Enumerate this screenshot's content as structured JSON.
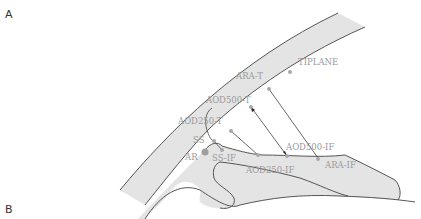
{
  "panels": {
    "a": {
      "label": "A"
    },
    "b": {
      "label": "B"
    }
  },
  "diagram": {
    "type": "anterior chamber angle schematic",
    "colors": {
      "tissue_fill": "#e4e4e4",
      "outline": "#555555",
      "label_text": "#9a9a9a",
      "landmark_dot": "#a8a8a8"
    },
    "landmarks": {
      "tiplane": "TIPLANE",
      "ara_t": "ARA-T",
      "aod500_t": "AOD500-T",
      "aod250_t": "AOD250-T",
      "ss": "SS",
      "ar": "AR",
      "ss_if": "SS-IF",
      "aod250_if": "AOD250-IF",
      "aod500_if": "AOD500-IF",
      "ara_if": "ARA-IF"
    }
  }
}
